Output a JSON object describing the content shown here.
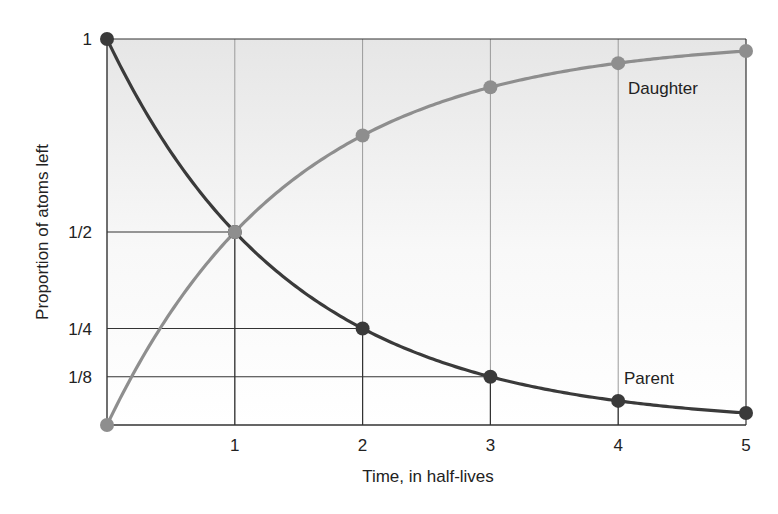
{
  "chart_data": {
    "type": "line",
    "title": "",
    "xlabel": "Time, in half-lives",
    "ylabel": "Proportion of atoms left",
    "x": [
      0,
      1,
      2,
      3,
      4,
      5
    ],
    "x_ticks": [
      "1",
      "2",
      "3",
      "4",
      "5"
    ],
    "y_ticks": [
      {
        "label": "1",
        "value": 1
      },
      {
        "label": "1/2",
        "value": 0.5
      },
      {
        "label": "1/4",
        "value": 0.25
      },
      {
        "label": "1/8",
        "value": 0.125
      }
    ],
    "xlim": [
      0,
      5
    ],
    "ylim": [
      0,
      1
    ],
    "grid": true,
    "series": [
      {
        "name": "Parent",
        "color": "#3a3a3a",
        "values": [
          1,
          0.5,
          0.25,
          0.125,
          0.0625,
          0.03125
        ]
      },
      {
        "name": "Daughter",
        "color": "#8e8e8e",
        "values": [
          0,
          0.5,
          0.75,
          0.875,
          0.9375,
          0.96875
        ]
      }
    ],
    "annotations": [
      {
        "text": "Daughter",
        "near_x": 4.5
      },
      {
        "text": "Parent",
        "near_x": 3.8
      }
    ]
  },
  "labels": {
    "xlabel": "Time, in half-lives",
    "ylabel": "Proportion of atoms left",
    "daughter": "Daughter",
    "parent": "Parent"
  }
}
